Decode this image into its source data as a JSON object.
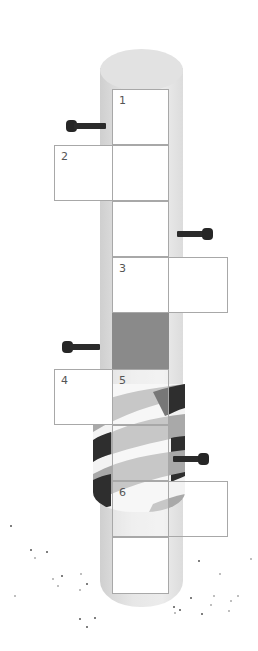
{
  "puzzle": {
    "type": "crossword-grid-on-pole",
    "clue_numbers": [
      "1",
      "2",
      "3",
      "4",
      "5",
      "6"
    ],
    "colors": {
      "pole": "#e2e2e2",
      "pole_shadow": "#cfcfcf",
      "grid_line": "#a8a8a8",
      "blocked_cell": "#8a8a8a",
      "bolt": "#2b2b2b",
      "stripe_dark": "#2e2e2e",
      "stripe_mid": "#a9a9a9",
      "stripe_light": "#f3f3f3"
    },
    "cells": [
      {
        "row": 0,
        "col": 1,
        "number": "1",
        "style": "white"
      },
      {
        "row": 1,
        "col": 0,
        "number": "2",
        "style": "white"
      },
      {
        "row": 1,
        "col": 1,
        "number": "",
        "style": "white"
      },
      {
        "row": 2,
        "col": 1,
        "number": "",
        "style": "white"
      },
      {
        "row": 3,
        "col": 1,
        "number": "3",
        "style": "white"
      },
      {
        "row": 3,
        "col": 2,
        "number": "",
        "style": "white"
      },
      {
        "row": 4,
        "col": 1,
        "number": "",
        "style": "dark"
      },
      {
        "row": 5,
        "col": 0,
        "number": "4",
        "style": "white"
      },
      {
        "row": 5,
        "col": 1,
        "number": "5",
        "style": "semi"
      },
      {
        "row": 6,
        "col": 1,
        "number": "",
        "style": "semi"
      },
      {
        "row": 7,
        "col": 1,
        "number": "6",
        "style": "semi"
      },
      {
        "row": 7,
        "col": 2,
        "number": "",
        "style": "clear"
      },
      {
        "row": 8,
        "col": 1,
        "number": "",
        "style": "clear"
      }
    ]
  }
}
